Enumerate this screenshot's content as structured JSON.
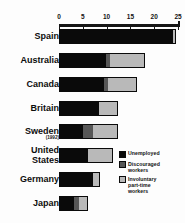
{
  "chart_data": {
    "type": "bar",
    "orientation": "horizontal",
    "stacked": true,
    "title": "",
    "subtitle": "",
    "xlabel": "",
    "ylabel": "",
    "xlim": [
      0,
      25
    ],
    "xticks": [
      0,
      5,
      10,
      15,
      20,
      25
    ],
    "xtick_labels": [
      "0",
      "5",
      "10",
      "15",
      "20",
      "25"
    ],
    "grid": false,
    "axis_position": "top",
    "legend_position": "inside-bottom-right",
    "categories": [
      "Spain",
      "Australia",
      "Canada",
      "Britain",
      "Sweden",
      "United States",
      "Germany",
      "Japan"
    ],
    "category_notes": {
      "Sweden": "(1992)"
    },
    "series": [
      {
        "name": "Unemployed",
        "color": "#0a0a0a",
        "values": [
          23.7,
          9.7,
          9.3,
          8.2,
          4.8,
          5.9,
          7.0,
          2.9
        ]
      },
      {
        "name": "Discouraged workers",
        "color": "#575757",
        "values": [
          0.0,
          0.8,
          0.7,
          0.0,
          2.2,
          0.0,
          0.0,
          1.1
        ]
      },
      {
        "name": "Involuntary part-time workers",
        "color": "#b9b9b9",
        "values": [
          0.8,
          7.5,
          6.4,
          4.2,
          5.4,
          5.4,
          1.6,
          2.1
        ]
      }
    ],
    "totals": [
      24.5,
      18.0,
      16.4,
      12.4,
      12.4,
      11.3,
      8.6,
      6.1
    ]
  },
  "legend": {
    "items": [
      {
        "label": "Unemployed",
        "swatch": "#0a0a0a",
        "swatch_name": "legend-swatch-unemployed"
      },
      {
        "label": "Discouraged\nworkers",
        "label_line1": "Discouraged",
        "label_line2": "workers",
        "swatch": "#575757",
        "swatch_name": "legend-swatch-discouraged"
      },
      {
        "label": "Involuntary\npart-time\nworkers",
        "label_line1": "Involuntary",
        "label_line2": "part-time",
        "label_line3": "workers",
        "swatch": "#b9b9b9",
        "swatch_name": "legend-swatch-involuntary"
      }
    ]
  },
  "rows": [
    {
      "label": "Spain",
      "sublabel": ""
    },
    {
      "label": "Australia",
      "sublabel": ""
    },
    {
      "label": "Canada",
      "sublabel": ""
    },
    {
      "label": "Britain",
      "sublabel": ""
    },
    {
      "label": "Sweden",
      "sublabel": "(1992)"
    },
    {
      "label": "United\nStates",
      "label_line1": "United",
      "label_line2": "States",
      "sublabel": ""
    },
    {
      "label": "Germany",
      "sublabel": ""
    },
    {
      "label": "Japan",
      "sublabel": ""
    }
  ],
  "axis": {
    "labels": [
      "0",
      "5",
      "10",
      "15",
      "20",
      "25"
    ]
  }
}
